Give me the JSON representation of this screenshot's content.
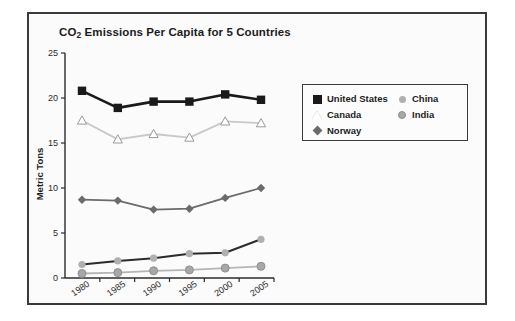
{
  "figure": {
    "title_prefix": "CO",
    "title_sub": "2",
    "title_suffix": " Emissions Per Capita for 5 Countries",
    "title_full": "CO2 Emissions Per Capita for 5 Countries"
  },
  "legend": {
    "entries": [
      {
        "label": "United States",
        "marker": "filled-square-icon",
        "color": "#1a1a1a",
        "line_color": "#1a1a1a"
      },
      {
        "label": "Canada",
        "marker": "open-triangle-icon",
        "color": "#ffffff",
        "line_color": "#c8c8c8"
      },
      {
        "label": "Norway",
        "marker": "filled-diamond-icon",
        "color": "#6b6b6b",
        "line_color": "#6b6b6b"
      },
      {
        "label": "China",
        "marker": "small-filled-circle-icon",
        "color": "#b0b0b0",
        "line_color": "#2b2b2b"
      },
      {
        "label": "India",
        "marker": "filled-circle-icon",
        "color": "#a8a8a8",
        "line_color": "#b5b5b5"
      }
    ]
  },
  "chart_data": {
    "type": "line",
    "title": "CO2 Emissions Per Capita for 5 Countries",
    "xlabel": "",
    "ylabel": "Metric Tons",
    "categories": [
      "1980",
      "1985",
      "1990",
      "1995",
      "2000",
      "2005"
    ],
    "ylim": [
      0,
      25
    ],
    "yticks": [
      0,
      5,
      10,
      15,
      20,
      25
    ],
    "grid": false,
    "legend_position": "right",
    "series": [
      {
        "name": "United States",
        "values": [
          20.8,
          18.9,
          19.6,
          19.6,
          20.4,
          19.8
        ]
      },
      {
        "name": "Canada",
        "values": [
          17.5,
          15.4,
          16.0,
          15.6,
          17.4,
          17.2
        ]
      },
      {
        "name": "Norway",
        "values": [
          8.7,
          8.6,
          7.6,
          7.7,
          8.9,
          10.0
        ]
      },
      {
        "name": "China",
        "values": [
          1.5,
          1.9,
          2.2,
          2.7,
          2.8,
          4.3
        ]
      },
      {
        "name": "India",
        "values": [
          0.5,
          0.6,
          0.8,
          0.9,
          1.1,
          1.3
        ]
      }
    ]
  }
}
